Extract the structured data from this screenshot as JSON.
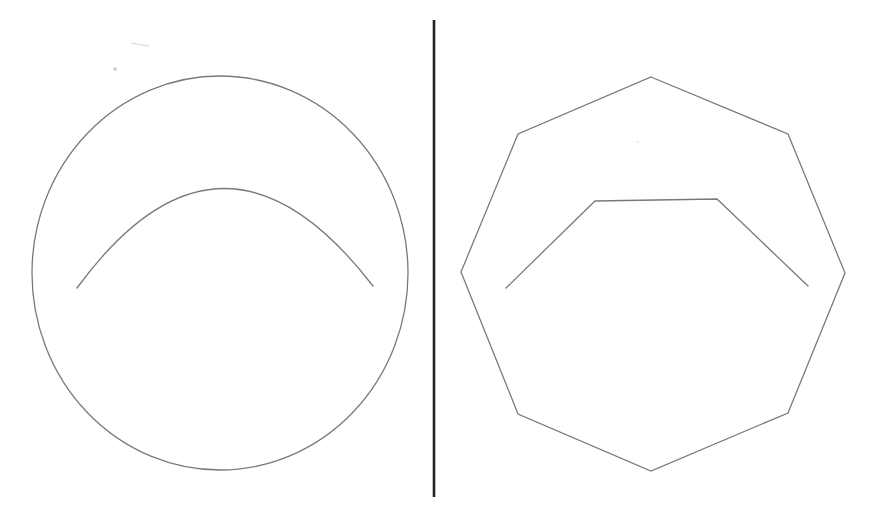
{
  "diagram": {
    "colors": {
      "background": "#ffffff",
      "stroke": "#7a7a7a",
      "divider": "#222222"
    },
    "left_panel": {
      "outer_shape": {
        "type": "ellipse",
        "cx": 220,
        "cy": 273,
        "rx": 188,
        "ry": 197
      },
      "inner_arc": {
        "type": "arc",
        "start": [
          77,
          288
        ],
        "control": [
          222,
          90
        ],
        "end": [
          373,
          286
        ]
      }
    },
    "divider": {
      "x": 434,
      "y1": 20,
      "y2": 497
    },
    "right_panel": {
      "outer_shape": {
        "type": "octagon",
        "points": [
          [
            651,
            77
          ],
          [
            788,
            134
          ],
          [
            845,
            273
          ],
          [
            788,
            413
          ],
          [
            651,
            471
          ],
          [
            518,
            414
          ],
          [
            461,
            272
          ],
          [
            518,
            134
          ]
        ]
      },
      "inner_polyline": {
        "type": "polyline",
        "points": [
          [
            506,
            288
          ],
          [
            595,
            201
          ],
          [
            717,
            199
          ],
          [
            808,
            286
          ]
        ]
      }
    }
  }
}
